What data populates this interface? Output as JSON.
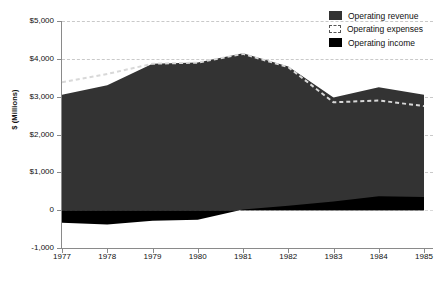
{
  "chart_data": {
    "type": "area",
    "title": "",
    "subtitle": "",
    "xlabel": "",
    "ylabel": "$ (Millions)",
    "categories": [
      "1977",
      "1978",
      "1979",
      "1980",
      "1981",
      "1982",
      "1983",
      "1984",
      "1985"
    ],
    "x_tick_labels": [
      "1977",
      "1978",
      "1979",
      "1980",
      "1981",
      "1982",
      "1983",
      "1984",
      "1985"
    ],
    "y_tick_labels": [
      "$5,000",
      "$4,000",
      "$3,000",
      "$2,000",
      "$1,000",
      "0",
      "-1,000"
    ],
    "y_tick_values": [
      5000,
      4000,
      3000,
      2000,
      1000,
      0,
      -1000
    ],
    "ylim": [
      -1000,
      5000
    ],
    "grid": true,
    "grid_style": "dashed-horizontal",
    "legend_position": "top-right",
    "series": [
      {
        "name": "Operating revenue",
        "style": "filled-area",
        "color": "#333333",
        "values": [
          3050,
          3300,
          3870,
          3900,
          4150,
          3800,
          2980,
          3250,
          3050
        ]
      },
      {
        "name": "Operating expenses",
        "style": "dashed-line",
        "color": "#d8d8d8",
        "values": [
          3380,
          3600,
          3870,
          3900,
          4130,
          3780,
          2850,
          2900,
          2750
        ]
      },
      {
        "name": "Operating income",
        "style": "filled-area",
        "color": "#000000",
        "values": [
          -330,
          -380,
          -280,
          -250,
          20,
          120,
          230,
          370,
          350
        ]
      }
    ]
  },
  "legend": {
    "items": [
      {
        "label": "Operating revenue",
        "swatch": "revenue-swatch"
      },
      {
        "label": "Operating expenses",
        "swatch": "expenses-swatch"
      },
      {
        "label": "Operating income",
        "swatch": "income-swatch"
      }
    ]
  },
  "colors": {
    "revenue": "#333333",
    "expenses": "#d8d8d8",
    "income": "#000000",
    "grid": "#c9c9c9",
    "axis": "#8a8a8a",
    "background": "#ffffff"
  }
}
